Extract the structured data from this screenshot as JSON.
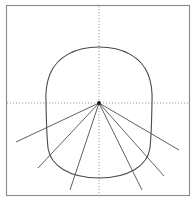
{
  "figure": {
    "canvas": {
      "width": 196,
      "height": 203,
      "background": "#ffffff"
    },
    "colors": {
      "frame": "#8a8a8a",
      "curve": "#4a4a4a",
      "ray": "#5a5a5a",
      "axis_dotted": "#9a9a9a",
      "focus_point": "#1a1a1a"
    },
    "frame": {
      "name": "outer-rectangle-border",
      "x": 6.5,
      "y": 5.5,
      "width": 183,
      "height": 190,
      "stroke_width": 1.1
    },
    "axes": {
      "horizontal": {
        "name": "horizontal-dotted-axis",
        "y": 103,
        "x_start": 7,
        "x_end": 189,
        "dash": "1.2 1.8",
        "stroke_width": 1
      },
      "vertical": {
        "name": "vertical-dotted-axis",
        "x": 99,
        "y_start": 6,
        "y_end": 195,
        "dash": "1.2 1.8",
        "stroke_width": 1
      }
    },
    "focus_point": {
      "name": "convergence-point",
      "cx": 99,
      "cy": 103,
      "r": 1.9
    },
    "closed_curve": {
      "name": "closed-oval-curve",
      "description": "Rounded dome-shaped closed curve, flat-ish bottom, vertical sides",
      "stroke_width": 1.1,
      "extents": {
        "top_y": 47,
        "bottom_y": 178,
        "left_x": 46,
        "right_x": 152
      },
      "path": "M 99 47 C 123 47 141 57 148 74 C 152 84 152.5 94 152 103 C 151.6 119 151.5 134 150 148 C 147.5 166 128 178 99 178 C 70 178 50.5 166 48 148 C 46.5 134 46.4 119 46 103 C 45.5 94 46 84 50 74 C 57 57 75 47 99 47 Z"
    },
    "rays": [
      {
        "name": "ray-left-upper",
        "x1": 99,
        "y1": 103,
        "x2": 16,
        "y2": 142
      },
      {
        "name": "ray-left-lower",
        "x1": 99,
        "y1": 103,
        "x2": 38,
        "y2": 168
      },
      {
        "name": "ray-left-steep",
        "x1": 99,
        "y1": 103,
        "x2": 70,
        "y2": 190
      },
      {
        "name": "ray-right-steep",
        "x1": 99,
        "y1": 103,
        "x2": 142,
        "y2": 190
      },
      {
        "name": "ray-right-lower",
        "x1": 99,
        "y1": 103,
        "x2": 164,
        "y2": 176
      },
      {
        "name": "ray-right-upper",
        "x1": 99,
        "y1": 103,
        "x2": 179,
        "y2": 150
      }
    ]
  }
}
